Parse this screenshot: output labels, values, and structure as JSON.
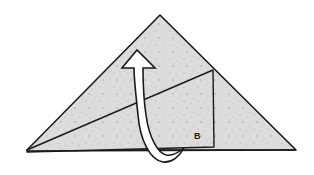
{
  "diagram": {
    "type": "origami-fold-step",
    "labels": {
      "flap_label": "B"
    },
    "colors": {
      "paper": "#dcdcdc",
      "paper_speckle": "#a8a8a8",
      "outline": "#1a1a1a",
      "arrow_fill": "#ffffff",
      "background": "#ffffff"
    },
    "arrow": {
      "direction": "up",
      "meaning": "fold flap B upward behind"
    }
  }
}
